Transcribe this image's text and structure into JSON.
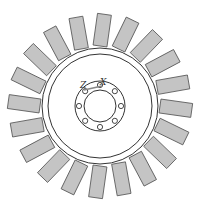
{
  "diagram": {
    "type": "turbine-disk",
    "center": [
      100,
      106
    ],
    "blade_count": 20,
    "blade": {
      "inner_r": 60,
      "outer_r": 92,
      "width": 14,
      "skew_deg": 8,
      "fill": "#c4c4c4",
      "stroke": "#555555"
    },
    "disk": {
      "rim_outer_r": 58,
      "rim_inner_r": 52,
      "stroke": "#333333"
    },
    "hub": {
      "ring_r": 25,
      "bore_r": 16,
      "bolt_circle_r": 21,
      "bolt_hole_r": 2.6,
      "bolt_count": 8
    },
    "axes": {
      "z_label": "Z",
      "x_label": "X"
    }
  }
}
